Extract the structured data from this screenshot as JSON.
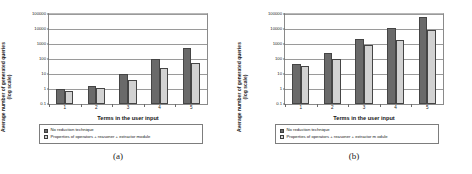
{
  "figure": {
    "panels": [
      {
        "caption": "(a)",
        "chart_data": {
          "type": "bar",
          "title": "",
          "xlabel": "Terms in the user input",
          "ylabel": "Average number of generated queries (log scale)",
          "ylabel_lines": [
            "Average number of generated queries",
            "(log scale)"
          ],
          "categories": [
            "1",
            "2",
            "3",
            "4",
            "5"
          ],
          "yscale": "log",
          "ylim": [
            0.1,
            100000
          ],
          "yticks": [
            "0.1",
            "1",
            "10",
            "100",
            "1000",
            "10000",
            "100000"
          ],
          "ytick_values": [
            0.1,
            1,
            10,
            100,
            1000,
            10000,
            100000
          ],
          "grid": true,
          "legend_position": "below-axis",
          "series": [
            {
              "name": "No reduction technique",
              "color": "#6a6a6a",
              "values": [
                1,
                1.6,
                10,
                95,
                550
              ]
            },
            {
              "name": "Properties of operators + reasoner + extractor module",
              "color": "#d2d2d2",
              "values": [
                0.75,
                1.2,
                4,
                25,
                58
              ]
            }
          ]
        }
      },
      {
        "caption": "(b)",
        "chart_data": {
          "type": "bar",
          "title": "",
          "xlabel": "Terms in the user input",
          "ylabel": "Average number of generated queries (log scale)",
          "ylabel_lines": [
            "Average number of generated queries",
            "(log scale)"
          ],
          "categories": [
            "1",
            "2",
            "3",
            "4",
            "5"
          ],
          "yscale": "log",
          "ylim": [
            0.1,
            100000
          ],
          "yticks": [
            "0.1",
            "1",
            "10",
            "100",
            "1000",
            "10000",
            "100000"
          ],
          "ytick_values": [
            0.1,
            1,
            10,
            100,
            1000,
            10000,
            100000
          ],
          "grid": true,
          "legend_position": "below-axis",
          "series": [
            {
              "name": "No reduction technique",
              "color": "#6a6a6a",
              "values": [
                50,
                260,
                2300,
                12000,
                65000
              ]
            },
            {
              "name": "Properties of operators + reasoner + extractor m odule",
              "color": "#d2d2d2",
              "values": [
                35,
                105,
                800,
                1900,
                8500
              ]
            }
          ]
        }
      }
    ]
  }
}
